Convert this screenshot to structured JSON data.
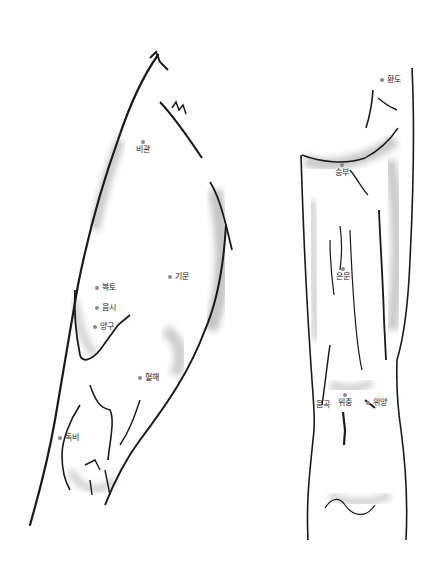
{
  "diagram": {
    "type": "anatomical-illustration",
    "colors": {
      "outline": "#1a1a1a",
      "shade": "#cfcfcf",
      "dot": "#8a8a8a",
      "label": "#222222"
    }
  },
  "front_leg": {
    "view": "thigh-front",
    "points": [
      {
        "label": "비관",
        "x": 143,
        "y": 142,
        "layout": "stack"
      },
      {
        "label": "복토",
        "x": 97,
        "y": 288,
        "layout": "right"
      },
      {
        "label": "음시",
        "x": 97,
        "y": 308,
        "layout": "right"
      },
      {
        "label": "양구",
        "x": 95,
        "y": 327,
        "layout": "right"
      },
      {
        "label": "기문",
        "x": 170,
        "y": 277,
        "layout": "right"
      },
      {
        "label": "혈해",
        "x": 140,
        "y": 378,
        "layout": "right"
      },
      {
        "label": "독비",
        "x": 60,
        "y": 438,
        "layout": "right"
      }
    ]
  },
  "back_leg": {
    "view": "leg-back",
    "points": [
      {
        "label": "환도",
        "x": 382,
        "y": 80,
        "layout": "right"
      },
      {
        "label": "승부",
        "x": 345,
        "y": 165,
        "layout": "stack"
      },
      {
        "label": "은문",
        "x": 346,
        "y": 270,
        "layout": "stack"
      },
      {
        "label": "음곡",
        "x": 326,
        "y": 400,
        "layout": "stack"
      },
      {
        "label": "위중",
        "x": 347,
        "y": 395,
        "layout": "stack"
      },
      {
        "label": "위양",
        "x": 370,
        "y": 398,
        "layout": "right"
      }
    ]
  }
}
